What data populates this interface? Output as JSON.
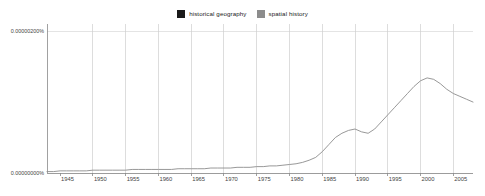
{
  "chart_data": {
    "type": "line",
    "title": "",
    "subtitle": "",
    "xlabel": "",
    "ylabel": "",
    "xlim": [
      1943,
      2008
    ],
    "ylim": [
      0.0,
      2.1e-06
    ],
    "grid": true,
    "legend_position": "top-center",
    "x_ticks": [
      "1945",
      "1950",
      "1955",
      "1960",
      "1965",
      "1970",
      "1975",
      "1980",
      "1985",
      "1990",
      "1995",
      "2000",
      "2005"
    ],
    "x_tick_values": [
      1945,
      1950,
      1955,
      1960,
      1965,
      1970,
      1975,
      1980,
      1985,
      1990,
      1995,
      2000,
      2005
    ],
    "y_ticks": [
      "0.00000000%",
      "0.00000200%",
      "0.00000400%",
      "0.00000600%",
      "0.00000800%",
      "0.00001000%",
      "0.00001200%",
      "0.00001400%",
      "0.00001600%",
      "0.00001800%",
      "0.00002000%"
    ],
    "y_tick_values": [
      0.0,
      2e-06,
      4e-06,
      6e-06,
      8e-06,
      1e-05,
      1.2e-05,
      1.4e-05,
      1.6e-05,
      1.8e-05,
      2e-05
    ],
    "x": [
      1943,
      1944,
      1945,
      1946,
      1947,
      1948,
      1949,
      1950,
      1951,
      1952,
      1953,
      1954,
      1955,
      1956,
      1957,
      1958,
      1959,
      1960,
      1961,
      1962,
      1963,
      1964,
      1965,
      1966,
      1967,
      1968,
      1969,
      1970,
      1971,
      1972,
      1973,
      1974,
      1975,
      1976,
      1977,
      1978,
      1979,
      1980,
      1981,
      1982,
      1983,
      1984,
      1985,
      1986,
      1987,
      1988,
      1989,
      1990,
      1991,
      1992,
      1993,
      1994,
      1995,
      1996,
      1997,
      1998,
      1999,
      2000,
      2001,
      2002,
      2003,
      2004,
      2005,
      2006,
      2007,
      2008
    ],
    "series": [
      {
        "name": "historical geography",
        "color": "#1a1a1a",
        "values": [
          7.6e-06,
          7.72e-06,
          8e-06,
          7.82e-06,
          7.68e-06,
          7.72e-06,
          7.78e-06,
          7.8e-06,
          8.1e-06,
          9.3e-06,
          9.9e-06,
          9.5e-06,
          1.03e-05,
          1.06e-05,
          1.075e-05,
          1.01e-05,
          9.85e-06,
          1e-05,
          1.055e-05,
          1.01e-05,
          1.08e-05,
          1.14e-05,
          1.23e-05,
          1.27e-05,
          1.275e-05,
          1.27e-05,
          1.25e-05,
          1.225e-05,
          1.24e-05,
          1.27e-05,
          1.36e-05,
          1.45e-05,
          1.54e-05,
          1.56e-05,
          1.59e-05,
          1.6e-05,
          1.56e-05,
          1.69e-05,
          1.79e-05,
          1.74e-05,
          1.94e-05,
          2.01e-05,
          2.04e-05,
          2.085e-05,
          2.095e-05,
          2.04e-05,
          1.84e-05,
          1.83e-05,
          1.855e-05,
          1.87e-05,
          1.855e-05,
          1.79e-05,
          1.725e-05,
          1.715e-05,
          1.72e-05,
          1.76e-05,
          1.745e-05,
          1.76e-05,
          1.82e-05,
          1.85e-05,
          1.81e-05,
          1.7e-05,
          1.54e-05,
          1.33e-05,
          1.16e-05,
          9.7e-06
        ],
        "peak_year": 1987,
        "peak_value": 2.095e-05
      },
      {
        "name": "spatial history",
        "color": "#8c8c8c",
        "values": [
          2e-08,
          2e-08,
          3e-08,
          3e-08,
          3e-08,
          3e-08,
          3e-08,
          4e-08,
          4e-08,
          4e-08,
          4e-08,
          4e-08,
          4e-08,
          5e-08,
          5e-08,
          5e-08,
          5e-08,
          5e-08,
          5e-08,
          5e-08,
          6e-08,
          6e-08,
          6e-08,
          6e-08,
          6e-08,
          7e-08,
          7e-08,
          7e-08,
          7e-08,
          8e-08,
          8e-08,
          8e-08,
          9e-08,
          9e-08,
          1e-07,
          1e-07,
          1.1e-07,
          1.2e-07,
          1.3e-07,
          1.5e-07,
          1.8e-07,
          2.2e-07,
          3e-07,
          4e-07,
          5e-07,
          5.6e-07,
          6e-07,
          6.2e-07,
          5.8e-07,
          5.6e-07,
          6.2e-07,
          7.2e-07,
          8.2e-07,
          9.2e-07,
          1.02e-06,
          1.12e-06,
          1.22e-06,
          1.3e-06,
          1.34e-06,
          1.32e-06,
          1.26e-06,
          1.18e-06,
          1.12e-06,
          1.08e-06,
          1.04e-06,
          1e-06
        ],
        "peak_year": 2001,
        "peak_value": 1.34e-06
      }
    ]
  },
  "legend": {
    "entries": [
      {
        "label": "historical geography",
        "color": "#1a1a1a"
      },
      {
        "label": "spatial history",
        "color": "#8c8c8c"
      }
    ]
  }
}
